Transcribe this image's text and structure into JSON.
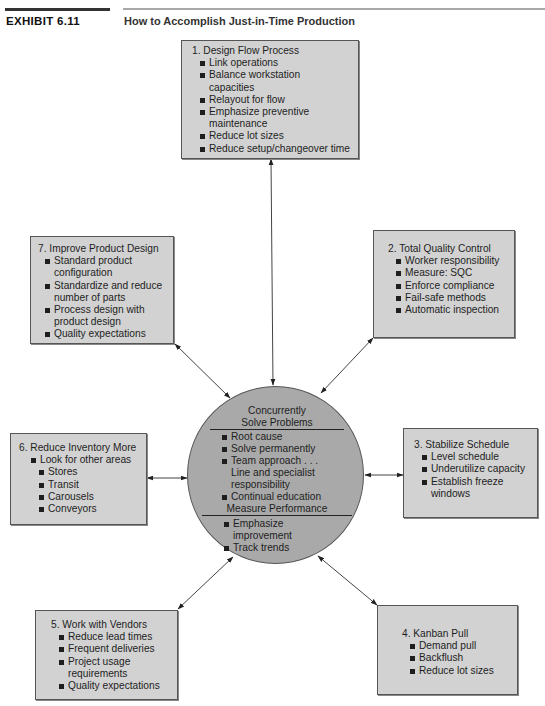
{
  "header": {
    "exhibit_label": "EXHIBIT 6.11",
    "title": "How to Accomplish Just-in-Time Production"
  },
  "center": {
    "section1_title_line1": "Concurrently",
    "section1_title_line2": "Solve Problems",
    "section1_items": [
      "Root cause",
      "Solve permanently",
      "Team approach . . .",
      "Continual education"
    ],
    "section1_item3_continuation_line1": "Line and specialist",
    "section1_item3_continuation_line2": "responsibility",
    "section2_title": "Measure Performance",
    "section2_items": [
      "Emphasize",
      "Track trends"
    ],
    "section2_item1_continuation": "improvement"
  },
  "boxes": {
    "b1": {
      "heading": "1. Design Flow Process",
      "items": [
        "Link operations",
        "Balance workstation",
        "Relayout for flow",
        "Emphasize preventive",
        "Reduce lot sizes",
        "Reduce setup/changeover time"
      ],
      "cont": [
        "capacities",
        "maintenance"
      ]
    },
    "b2": {
      "heading": "2. Total Quality Control",
      "items": [
        "Worker responsibility",
        "Measure: SQC",
        "Enforce compliance",
        "Fail-safe methods",
        "Automatic inspection"
      ]
    },
    "b3": {
      "heading": "3. Stabilize Schedule",
      "items": [
        "Level schedule",
        "Underutilize capacity",
        "Establish freeze"
      ],
      "cont": [
        "windows"
      ]
    },
    "b4": {
      "heading": "4. Kanban Pull",
      "items": [
        "Demand pull",
        "Backflush",
        "Reduce lot sizes"
      ]
    },
    "b5": {
      "heading": "5. Work with Vendors",
      "items": [
        "Reduce lead times",
        "Frequent deliveries",
        "Project usage",
        "Quality expectations"
      ],
      "cont": [
        "requirements"
      ]
    },
    "b6": {
      "heading": "6. Reduce Inventory More",
      "items": [
        "Look for other areas"
      ],
      "subitems": [
        "Stores",
        "Transit",
        "Carousels",
        "Conveyors"
      ]
    },
    "b7": {
      "heading": "7. Improve Product Design",
      "items": [
        "Standard product",
        "Standardize and reduce",
        "Process design with",
        "Quality expectations"
      ],
      "cont": [
        "configuration",
        "number of parts",
        "product design"
      ]
    }
  },
  "colors": {
    "box_fill": "#d2d2d2",
    "circle_fill": "#a9a9a9",
    "line": "#333333"
  }
}
